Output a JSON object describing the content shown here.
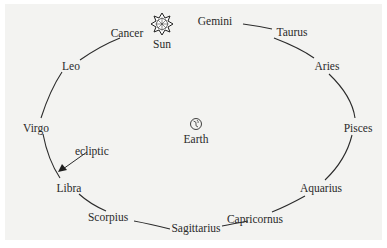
{
  "diagram": {
    "center_object": {
      "symbol": "earth-symbol",
      "label": "Earth"
    },
    "sun": {
      "symbol": "sun-star",
      "label": "Sun"
    },
    "ecliptic_label": "ecliptic",
    "constellations": [
      "Gemini",
      "Taurus",
      "Aries",
      "Pisces",
      "Aquarius",
      "Capricornus",
      "Sagittarius",
      "Scorpius",
      "Libra",
      "Virgo",
      "Leo",
      "Cancer"
    ]
  }
}
